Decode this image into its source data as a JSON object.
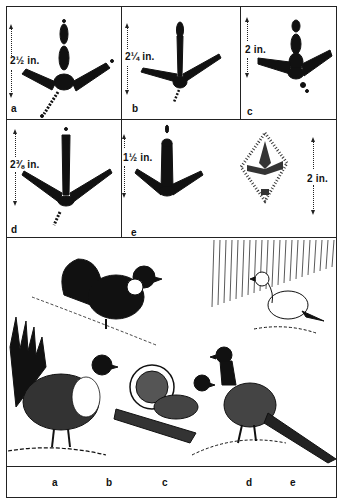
{
  "figure": {
    "type": "illustration-plate"
  },
  "tracks": [
    {
      "id": "a",
      "letter": "a",
      "measurement": "2½ in.",
      "style": "barred-toes-with-spur"
    },
    {
      "id": "b",
      "letter": "b",
      "measurement": "2¼ in.",
      "style": "thin-barred-toes"
    },
    {
      "id": "c",
      "letter": "c",
      "measurement": "2 in.",
      "style": "barred-toes-with-spur"
    },
    {
      "id": "d",
      "letter": "d",
      "measurement": "2⅜ in.",
      "style": "long-barred-toes-with-spur"
    },
    {
      "id": "e",
      "letter": "e",
      "measurement": "1½ in.",
      "style": "short-barred-toes"
    },
    {
      "id": "e-snow",
      "letter": "",
      "measurement": "2 in.",
      "style": "feathered-snow-track"
    }
  ],
  "birds_panel": {
    "birds": [
      {
        "position": "top-left",
        "description": "dark grouse with fanned tail and white neck sac, displaying"
      },
      {
        "position": "top-right",
        "description": "white ptarmigan-like bird in snow"
      },
      {
        "position": "bottom-left",
        "description": "sage grouse with spiky fanned tail"
      },
      {
        "position": "bottom-center",
        "description": "ruffed grouse drumming on log with fanned tail"
      },
      {
        "position": "bottom-right",
        "description": "ring-necked pheasant with long barred tail"
      }
    ]
  },
  "bottom_labels": [
    "a",
    "b",
    "c",
    "d",
    "e"
  ],
  "colors": {
    "ink": "#111111",
    "paper": "#ffffff"
  }
}
